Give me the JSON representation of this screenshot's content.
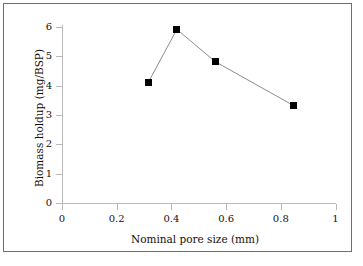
{
  "chart_data": {
    "type": "line",
    "title": "",
    "xlabel": "Nominal pore size (mm)",
    "ylabel": "Biomass holdup (mg/BSP)",
    "xlim": [
      0,
      1
    ],
    "ylim": [
      0,
      6
    ],
    "xticks": [
      "0",
      "0.2",
      "0.4",
      "0.6",
      "0.8",
      "1"
    ],
    "xtick_values": [
      0,
      0.2,
      0.4,
      0.6,
      0.8,
      1
    ],
    "yticks": [
      "0",
      "1",
      "2",
      "3",
      "4",
      "5",
      "6"
    ],
    "ytick_values": [
      0,
      1,
      2,
      3,
      4,
      5,
      6
    ],
    "grid": false,
    "legend": null,
    "marker": "square",
    "marker_color": "#000000",
    "line_color": "#8c8c8c",
    "axis_color": "#b9b9b9",
    "x": [
      0.315,
      0.42,
      0.56,
      0.845
    ],
    "values": [
      4.1,
      5.92,
      4.82,
      3.33
    ],
    "series": [
      {
        "name": "Biomass holdup",
        "points": [
          {
            "x": 0.315,
            "y": 4.1
          },
          {
            "x": 0.42,
            "y": 5.92
          },
          {
            "x": 0.56,
            "y": 4.82
          },
          {
            "x": 0.845,
            "y": 3.33
          }
        ]
      }
    ]
  },
  "figure": {
    "border_color": "#6e6e6e",
    "background": "#ffffff"
  }
}
